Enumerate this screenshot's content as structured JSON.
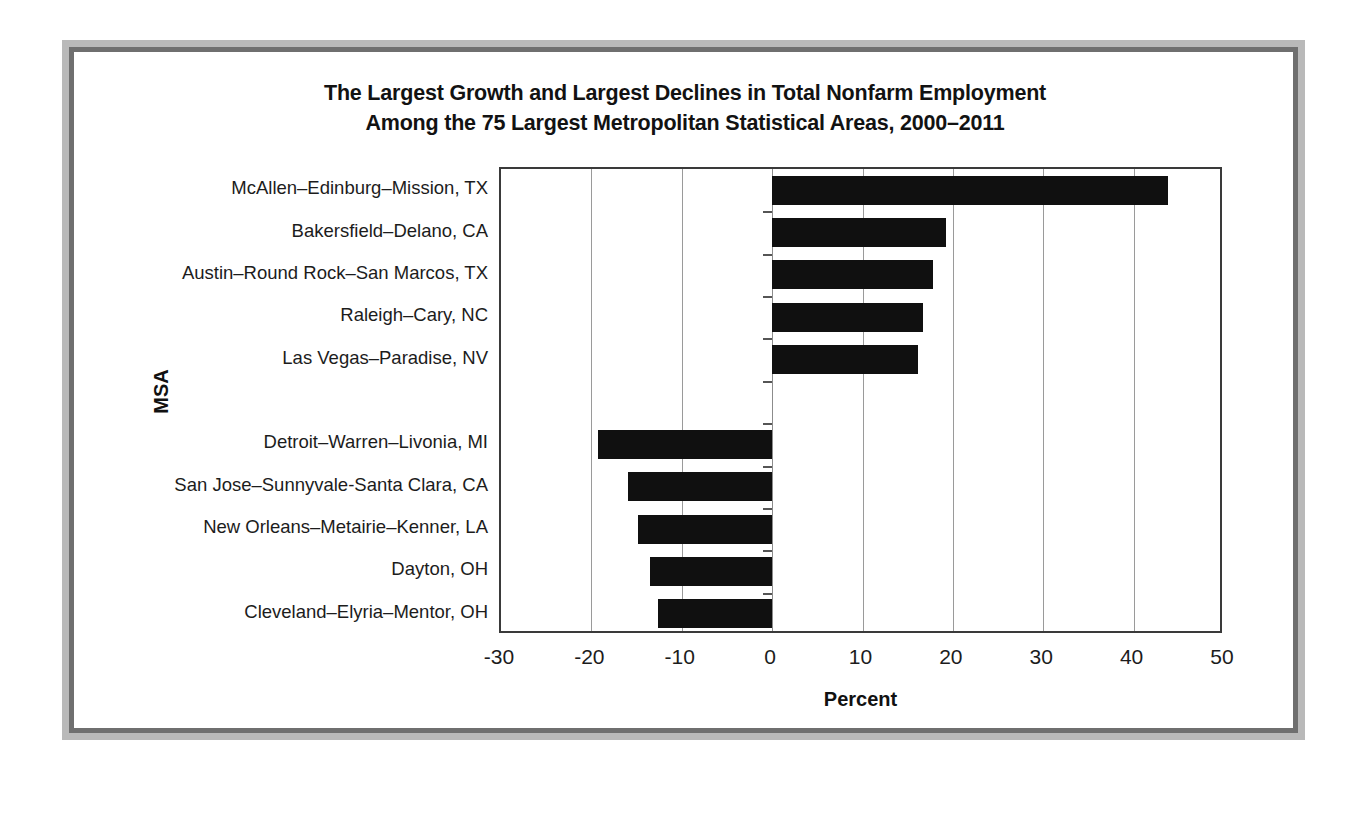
{
  "chart_data": {
    "type": "bar",
    "orientation": "horizontal",
    "title": "The Largest Growth and Largest Declines in Total Nonfarm Employment Among the 75 Largest Metropolitan Statistical Areas, 2000–2011",
    "title_lines": [
      "The Largest Growth and Largest Declines in Total Nonfarm Employment",
      "Among the 75 Largest Metropolitan Statistical Areas, 2000–2011"
    ],
    "xlabel": "Percent",
    "ylabel": "MSA",
    "xlim": [
      -30,
      50
    ],
    "xticks": [
      -30,
      -20,
      -10,
      0,
      10,
      20,
      30,
      40,
      50
    ],
    "xtick_labels": [
      "-30",
      "-20",
      "-10",
      "0",
      "10",
      "20",
      "30",
      "40",
      "50"
    ],
    "grid": "vertical",
    "legend": "none",
    "bar_color": "#101010",
    "categories": [
      "McAllen–Edinburg–Mission, TX",
      "Bakersfield–Delano, CA",
      "Austin–Round Rock–San Marcos, TX",
      "Raleigh–Cary, NC",
      "Las Vegas–Paradise, NV",
      "",
      "Detroit–Warren–Livonia, MI",
      "San Jose–Sunnyvale-Santa Clara, CA",
      "New Orleans–Metairie–Kenner, LA",
      "Dayton, OH",
      "Cleveland–Elyria–Mentor, OH"
    ],
    "values": [
      43.8,
      19.2,
      17.8,
      16.7,
      16.1,
      null,
      -19.3,
      -15.9,
      -14.8,
      -13.5,
      -12.6
    ]
  },
  "frame": {
    "outer_color": "#b9b9b9",
    "inner_color": "#6f6f6f"
  }
}
